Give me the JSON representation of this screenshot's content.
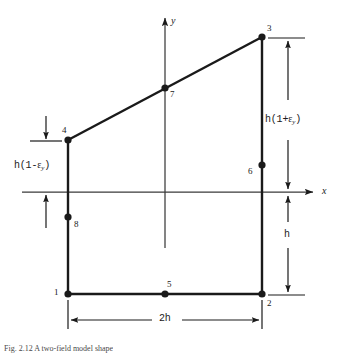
{
  "figure": {
    "caption": "Fig. 2.12  A two-field model shape",
    "background_color": "#ffffff",
    "line_color": "#1a1a1a",
    "axis_color": "#3a3a3a"
  },
  "axes": {
    "x_label": "x",
    "y_label": "y",
    "origin_x": 165,
    "origin_y": 192
  },
  "nodes": [
    {
      "id": "1",
      "label": "1",
      "x": 68,
      "y": 294,
      "label_dx": -12,
      "label_dy": -1
    },
    {
      "id": "2",
      "label": "2",
      "x": 262,
      "y": 294,
      "label_dx": 5,
      "label_dy": 9
    },
    {
      "id": "3",
      "label": "3",
      "x": 262,
      "y": 37,
      "label_dx": 5,
      "label_dy": -9
    },
    {
      "id": "4",
      "label": "4",
      "x": 68,
      "y": 140,
      "label_dx": -4,
      "label_dy": -10
    },
    {
      "id": "5",
      "label": "5",
      "x": 165,
      "y": 294,
      "label_dx": 2,
      "label_dy": -10
    },
    {
      "id": "6",
      "label": "6",
      "x": 262,
      "y": 165,
      "label_dx": -13,
      "label_dy": 7
    },
    {
      "id": "7",
      "label": "7",
      "x": 165,
      "y": 88,
      "label_dx": 5,
      "label_dy": 6
    },
    {
      "id": "8",
      "label": "8",
      "x": 68,
      "y": 217,
      "label_dx": 6,
      "label_dy": 7
    }
  ],
  "dimensions": {
    "left": {
      "name": "left-height-dimension",
      "text_main": "h(1-",
      "text_eps": "ε",
      "text_sub": "y",
      "text_close": ")",
      "full_text": "h(1-εy)"
    },
    "right": {
      "name": "right-height-dimension",
      "text_main": "h(1+",
      "text_eps": "ε",
      "text_sub": "y",
      "text_close": ")",
      "full_text": "h(1+εy)"
    },
    "lower_right": {
      "name": "lower-height-dimension",
      "text": "h"
    },
    "bottom": {
      "name": "width-dimension",
      "text": "2h"
    }
  }
}
